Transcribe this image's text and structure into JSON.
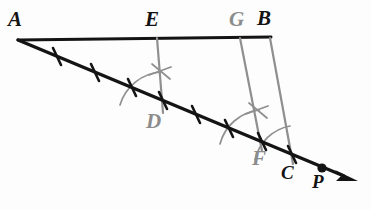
{
  "figure": {
    "kind": "geometry-construction-diagram",
    "background_color": "#fdfdfd",
    "black_ink_color": "#141414",
    "gray_ink_color": "#8f8f8f"
  },
  "points": [
    {
      "id": "A",
      "label": "A",
      "x": 18,
      "y": 40,
      "label_x": 8,
      "label_y": 9,
      "color": "black"
    },
    {
      "id": "E",
      "label": "E",
      "x": 157,
      "y": 38,
      "label_x": 145,
      "label_y": 9,
      "color": "black"
    },
    {
      "id": "G",
      "label": "G",
      "x": 240,
      "y": 37,
      "label_x": 229,
      "label_y": 9,
      "color": "gray"
    },
    {
      "id": "B",
      "label": "B",
      "x": 270,
      "y": 37,
      "label_x": 256,
      "label_y": 8,
      "color": "black"
    },
    {
      "id": "D",
      "label": "D",
      "x": 163,
      "y": 112,
      "label_x": 146,
      "label_y": 111,
      "color": "gray"
    },
    {
      "id": "F",
      "label": "F",
      "x": 262,
      "y": 150,
      "label_x": 253,
      "label_y": 148,
      "color": "gray"
    },
    {
      "id": "C",
      "label": "C",
      "x": 292,
      "y": 163,
      "label_x": 281,
      "label_y": 163,
      "color": "black"
    },
    {
      "id": "P",
      "label": "P",
      "x": 322,
      "y": 168,
      "label_x": 312,
      "label_y": 172,
      "color": "black"
    }
  ],
  "segments": [
    {
      "name": "segment-AB",
      "from": "A",
      "to": "B",
      "color": "black",
      "width": 3.0
    },
    {
      "name": "ray-A-to-P",
      "from": "A",
      "to": "P",
      "color": "black",
      "width": 3.4,
      "arrow": true
    },
    {
      "name": "segment-ED",
      "from": "E",
      "to": "D",
      "color": "gray",
      "width": 2.2
    },
    {
      "name": "segment-GF",
      "from": "G",
      "to": "F",
      "color": "gray",
      "width": 2.2
    },
    {
      "name": "segment-BC",
      "from": "B",
      "to": "C",
      "color": "gray",
      "width": 2.2
    }
  ],
  "tick_marks": {
    "name": "congruent-segment-ticks",
    "count": 6,
    "note": "six equal divisions of A-C at the 1/6 .. 6/6 positions along the ray",
    "color": "black"
  },
  "construction_arcs": [
    {
      "name": "arc-at-D",
      "note": "compass arc sweeping from ray AC up to segment ED"
    },
    {
      "name": "arc-at-F",
      "note": "compass arc sweeping from ray AC up to segment GF"
    },
    {
      "name": "arc-at-C",
      "note": "compass arc sweeping from ray AC up to segment BC"
    }
  ],
  "construction_crosses": [
    {
      "name": "cross-on-ED",
      "note": "X mark indicating equal angle/length on segment ED"
    },
    {
      "name": "cross-on-GF",
      "note": "X mark indicating equal angle/length on segment GF"
    }
  ],
  "marker_dot": {
    "name": "point-P-dot",
    "at": "P",
    "color": "black",
    "radius": 4.6
  },
  "arrowhead": {
    "name": "ray-arrowhead",
    "tip_x": 352,
    "tip_y": 179,
    "color": "black"
  }
}
